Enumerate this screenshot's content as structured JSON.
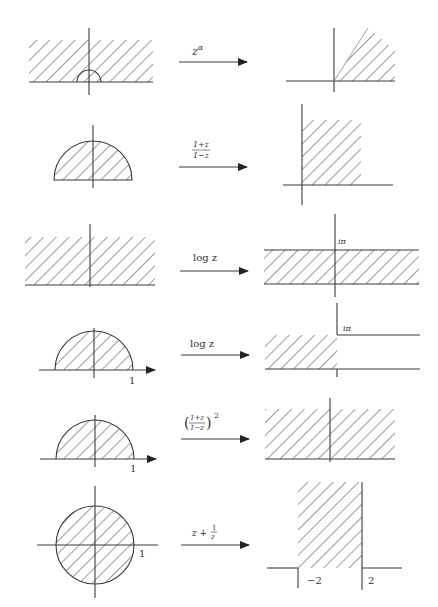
{
  "figure": {
    "rows": [
      {
        "id": "power",
        "source": {
          "region": "upper half-plane with small semicircle at origin"
        },
        "map_label": {
          "base": "z",
          "exponent": "α"
        },
        "target": {
          "region": "wedge/sector in first quadrant"
        }
      },
      {
        "id": "mobius",
        "source": {
          "region": "upper half unit disk"
        },
        "map_label": {
          "numerator": "1+z",
          "denominator": "1−z"
        },
        "target": {
          "region": "first quadrant"
        }
      },
      {
        "id": "log-halfplane",
        "source": {
          "region": "upper half-plane"
        },
        "map_label": {
          "text": "log z"
        },
        "target": {
          "region": "horizontal strip 0 < Im < π",
          "label": "iπ"
        }
      },
      {
        "id": "log-halfdisk",
        "source": {
          "region": "upper half unit disk",
          "tick_label": "1"
        },
        "map_label": {
          "text": "log z"
        },
        "target": {
          "region": "half-strip Re < 0, 0 < Im < π",
          "label": "iπ"
        }
      },
      {
        "id": "mobius-squared",
        "source": {
          "region": "upper half unit disk",
          "tick_label": "1"
        },
        "map_label": {
          "numerator": "1+z",
          "denominator": "1−z",
          "exponent": "2"
        },
        "target": {
          "region": "upper half-plane"
        }
      },
      {
        "id": "joukowski",
        "source": {
          "region": "unit disk",
          "tick_label": "1"
        },
        "map_label": {
          "prefix": "z +",
          "numerator": "1",
          "denominator": "z"
        },
        "target": {
          "region": "vertical strip −2 < Re < 2",
          "tick_labels": [
            "−2",
            "2"
          ]
        }
      }
    ]
  }
}
